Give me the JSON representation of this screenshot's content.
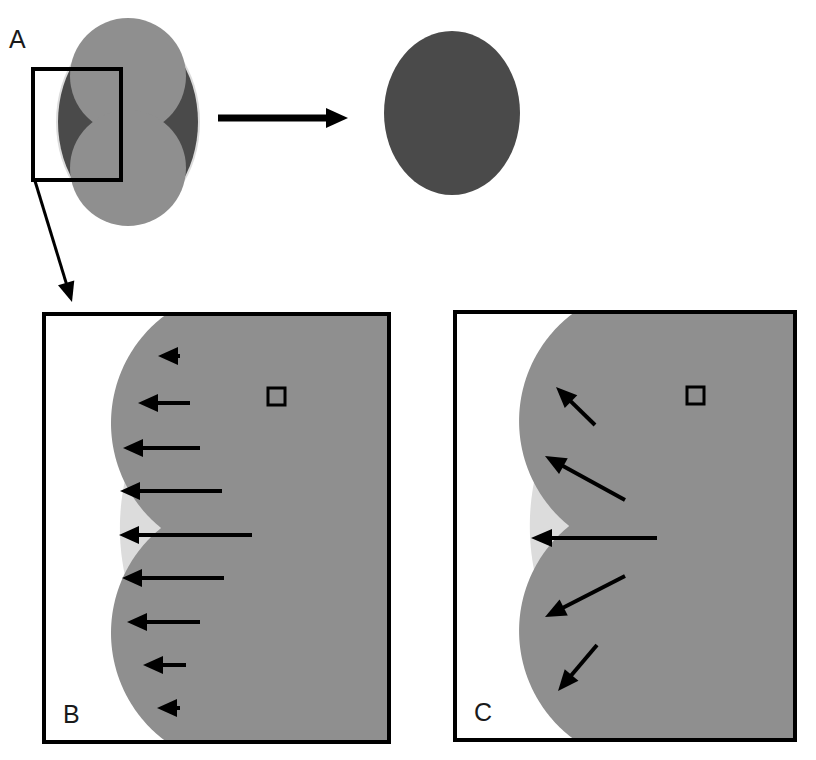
{
  "figure": {
    "type": "scientific-diagram",
    "background_color": "#ffffff",
    "width": 816,
    "height": 760,
    "panels": [
      {
        "id": "A",
        "label": "A",
        "label_x": 9,
        "label_y": 27
      },
      {
        "id": "B",
        "label": "B",
        "label_x": 63,
        "label_y": 702
      },
      {
        "id": "C",
        "label": "C",
        "label_x": 474,
        "label_y": 700
      }
    ]
  },
  "colors": {
    "outline": "#000000",
    "light_gray": "#dcdcdc",
    "medium_gray": "#8f8f8f",
    "dark_gray": "#4a4a4a",
    "white": "#ffffff",
    "label_text": "#1a1a1a"
  },
  "panel_a": {
    "left_shape": {
      "name": "initial-cell-shape",
      "outer_ellipse": {
        "cx": 128,
        "cy": 122,
        "rx": 72,
        "ry": 96,
        "fill": "#dcdcdc"
      },
      "dark_crescent_ellipse": {
        "cx": 128,
        "cy": 122,
        "rx": 70,
        "ry": 94,
        "fill": "#4a4a4a"
      },
      "figure_eight": {
        "fill": "#8f8f8f",
        "lobe_top": {
          "cx": 128,
          "cy": 76,
          "r": 58
        },
        "lobe_bottom": {
          "cx": 128,
          "cy": 168,
          "r": 58
        }
      }
    },
    "transition_arrow": {
      "name": "transformation-arrow",
      "x1": 218,
      "y1": 118,
      "x2": 348,
      "y2": 118,
      "stroke_width": 7,
      "head_length": 22,
      "head_width": 20
    },
    "right_shape": {
      "name": "final-cell-shape",
      "ellipse": {
        "cx": 452,
        "cy": 113,
        "rx": 68,
        "ry": 82,
        "fill": "#4a4a4a"
      }
    },
    "inset_box": {
      "name": "inset-region-box",
      "x": 33,
      "y": 69,
      "width": 88,
      "height": 111,
      "stroke_width": 4
    },
    "pointer_line": {
      "name": "inset-pointer-arrow",
      "x1": 35,
      "y1": 181,
      "x2": 72,
      "y2": 302,
      "stroke_width": 3,
      "head_length": 20,
      "head_width": 17
    }
  },
  "panel_b": {
    "name": "panel-b-normal-growth",
    "frame": {
      "x": 44,
      "y": 314,
      "width": 345,
      "height": 428,
      "stroke_width": 4
    },
    "description": "horizontal arrows",
    "arrow_style": "horizontal",
    "arrow_stroke_width": 4,
    "head_length": 20,
    "head_width": 18,
    "arrows": [
      {
        "tail_x": 180,
        "tail_y": 356,
        "tip_x": 158,
        "tip_y": 356
      },
      {
        "tail_x": 190,
        "tail_y": 403,
        "tip_x": 138,
        "tip_y": 403
      },
      {
        "tail_x": 200,
        "tail_y": 448,
        "tip_x": 123,
        "tip_y": 448
      },
      {
        "tail_x": 222,
        "tail_y": 491,
        "tip_x": 120,
        "tip_y": 491
      },
      {
        "tail_x": 252,
        "tail_y": 535,
        "tip_x": 119,
        "tip_y": 535
      },
      {
        "tail_x": 224,
        "tail_y": 578,
        "tip_x": 122,
        "tip_y": 578
      },
      {
        "tail_x": 200,
        "tail_y": 622,
        "tip_x": 127,
        "tip_y": 622
      },
      {
        "tail_x": 186,
        "tail_y": 665,
        "tip_x": 143,
        "tip_y": 665
      },
      {
        "tail_x": 180,
        "tail_y": 708,
        "tip_x": 157,
        "tip_y": 708
      }
    ],
    "marker_square": {
      "name": "reference-square",
      "x": 268,
      "y": 388,
      "size": 17,
      "stroke_width": 3
    },
    "light_region_fill": "#dcdcdc",
    "dark_region_fill": "#8f8f8f"
  },
  "panel_c": {
    "name": "panel-c-normal-direction-growth",
    "frame": {
      "x": 455,
      "y": 312,
      "width": 340,
      "height": 428,
      "stroke_width": 4
    },
    "description": "arrows normal to surface",
    "arrow_style": "surface-normal",
    "arrow_stroke_width": 4,
    "head_length": 21,
    "head_width": 18,
    "arrows": [
      {
        "tail_x": 595,
        "tail_y": 425,
        "tip_x": 556,
        "tip_y": 387
      },
      {
        "tail_x": 625,
        "tail_y": 500,
        "tip_x": 545,
        "tip_y": 456
      },
      {
        "tail_x": 657,
        "tail_y": 538,
        "tip_x": 531,
        "tip_y": 538
      },
      {
        "tail_x": 625,
        "tail_y": 576,
        "tip_x": 545,
        "tip_y": 617
      },
      {
        "tail_x": 597,
        "tail_y": 645,
        "tip_x": 558,
        "tip_y": 691
      }
    ],
    "marker_square": {
      "name": "reference-square",
      "x": 687,
      "y": 387,
      "size": 17,
      "stroke_width": 3
    },
    "light_region_fill": "#dcdcdc",
    "dark_region_fill": "#8f8f8f"
  }
}
